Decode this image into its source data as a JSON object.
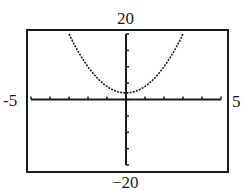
{
  "window": {
    "xmin": "-5",
    "xmax": "5",
    "ymin": "−20",
    "ymax": "20"
  },
  "chart_data": {
    "type": "line",
    "title": "",
    "xlabel": "",
    "ylabel": "",
    "xlim": [
      -5,
      5
    ],
    "ylim": [
      -20,
      20
    ],
    "x_tick_step": 1,
    "y_tick_step": 5,
    "grid": false,
    "series": [
      {
        "name": "parabola (approx. y = 2x^2 + 2)",
        "x": [
          -3,
          -2.5,
          -2,
          -1.5,
          -1,
          -0.5,
          0,
          0.5,
          1,
          1.5,
          2,
          2.5,
          3
        ],
        "values": [
          20,
          14.5,
          10,
          6.5,
          4,
          2.5,
          2,
          2.5,
          4,
          6.5,
          10,
          14.5,
          20
        ]
      }
    ],
    "window_labels": {
      "top": "20",
      "bottom": "-20",
      "left": "-5",
      "right": "5"
    }
  },
  "colors": {
    "ink": "#1a1a1a",
    "background": "#ffffff"
  }
}
